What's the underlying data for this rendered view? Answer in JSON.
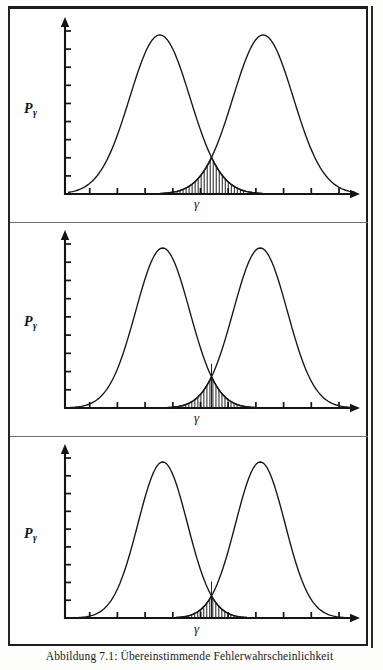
{
  "figure": {
    "caption": "Abbildung 7.1: Übereinstimmende Fehlerwahrscheinlichkeit",
    "y_axis_label_base": "P",
    "y_axis_label_sub": "γ",
    "x_axis_label": "γ",
    "panel_count": 3,
    "ink_color": "#141414",
    "page_color": "#ffffff"
  },
  "chart_data": [
    {
      "type": "line",
      "title": "",
      "xlabel": "γ",
      "ylabel": "Pγ",
      "panel_index": 1,
      "grid": false,
      "legend": "none",
      "xlim": [
        0,
        100
      ],
      "ylim": [
        0,
        1.05
      ],
      "x_tick_count": 10,
      "y_tick_count": 9,
      "threshold_x": 50,
      "shaded_region": {
        "label": "overlap error probability",
        "style": "vertical-hatch",
        "x_start": 38,
        "x_end": 62,
        "peak_height": 0.118
      },
      "series": [
        {
          "name": "distribution-left",
          "mean": 32,
          "sigma": 10.5,
          "peak": 1.0
        },
        {
          "name": "distribution-right",
          "mean": 68,
          "sigma": 10.5,
          "peak": 1.0
        }
      ]
    },
    {
      "type": "line",
      "title": "",
      "xlabel": "γ",
      "ylabel": "Pγ",
      "panel_index": 2,
      "grid": false,
      "legend": "none",
      "xlim": [
        0,
        100
      ],
      "ylim": [
        0,
        1.05
      ],
      "x_tick_count": 10,
      "y_tick_count": 9,
      "threshold_x": 50,
      "shaded_region": {
        "label": "overlap error probability",
        "style": "vertical-hatch",
        "x_start": 40,
        "x_end": 60,
        "peak_height": 0.175
      },
      "series": [
        {
          "name": "distribution-left",
          "mean": 33,
          "sigma": 9.4,
          "peak": 1.0
        },
        {
          "name": "distribution-right",
          "mean": 67,
          "sigma": 9.4,
          "peak": 1.0
        }
      ]
    },
    {
      "type": "line",
      "title": "",
      "xlabel": "γ",
      "ylabel": "Pγ",
      "panel_index": 3,
      "grid": false,
      "legend": "none",
      "xlim": [
        0,
        100
      ],
      "ylim": [
        0,
        1.05
      ],
      "x_tick_count": 10,
      "y_tick_count": 9,
      "threshold_x": 50,
      "shaded_region": {
        "label": "overlap error probability",
        "style": "vertical-hatch",
        "x_start": 41,
        "x_end": 59,
        "peak_height": 0.205
      },
      "series": [
        {
          "name": "distribution-left",
          "mean": 33,
          "sigma": 8.6,
          "peak": 1.0
        },
        {
          "name": "distribution-right",
          "mean": 67,
          "sigma": 8.6,
          "peak": 1.0
        }
      ]
    }
  ]
}
